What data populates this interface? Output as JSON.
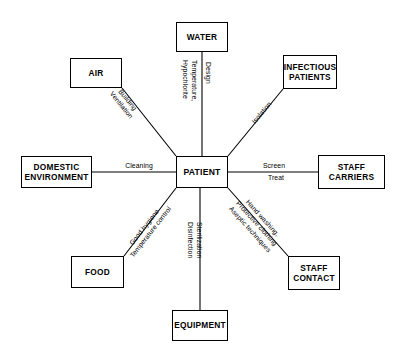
{
  "diagram": {
    "type": "radial-spoke-diagram",
    "center": {
      "id": "patient",
      "label": "PATIENT"
    },
    "nodes": [
      {
        "id": "water",
        "label": "WATER"
      },
      {
        "id": "air",
        "label": "AIR"
      },
      {
        "id": "infectious-patients",
        "label": "INFECTIOUS\nPATIENTS"
      },
      {
        "id": "domestic-environment",
        "label": "DOMESTIC\nENVIRONMENT"
      },
      {
        "id": "staff-carriers",
        "label": "STAFF\nCARRIERS"
      },
      {
        "id": "food",
        "label": "FOOD"
      },
      {
        "id": "staff-contact",
        "label": "STAFF\nCONTACT"
      },
      {
        "id": "equipment",
        "label": "EQUIPMENT"
      }
    ],
    "edges": [
      {
        "id": "water-patient",
        "from": "water",
        "to": "patient",
        "labels": [
          {
            "id": "water-left",
            "text": "Temperature,\nHypochlorite"
          },
          {
            "id": "water-right",
            "text": "Design"
          }
        ]
      },
      {
        "id": "air-patient",
        "from": "air",
        "to": "patient",
        "labels": [
          {
            "id": "air-measures",
            "text": "Building\nVentilation"
          }
        ]
      },
      {
        "id": "infectious-patients-patient",
        "from": "infectious-patients",
        "to": "patient",
        "labels": [
          {
            "id": "infectious-measure",
            "text": "Isolation"
          }
        ]
      },
      {
        "id": "domestic-environment-patient",
        "from": "domestic-environment",
        "to": "patient",
        "labels": [
          {
            "id": "domestic-measure",
            "text": "Cleaning"
          }
        ]
      },
      {
        "id": "staff-carriers-patient",
        "from": "staff-carriers",
        "to": "patient",
        "labels": [
          {
            "id": "carriers-above",
            "text": "Screen"
          },
          {
            "id": "carriers-below",
            "text": "Treat"
          }
        ]
      },
      {
        "id": "food-patient",
        "from": "food",
        "to": "patient",
        "labels": [
          {
            "id": "food-measures",
            "text": "Good hygiene\nTemperature control"
          }
        ]
      },
      {
        "id": "staff-contact-patient",
        "from": "staff-contact",
        "to": "patient",
        "labels": [
          {
            "id": "contact-measures",
            "text": "Hand washing,\nProtective clothing\nAseptic techniques"
          }
        ]
      },
      {
        "id": "equipment-patient",
        "from": "equipment",
        "to": "patient",
        "labels": [
          {
            "id": "equipment-measures",
            "text": "Sterilization\nDisinfection"
          }
        ]
      }
    ],
    "colors": {
      "background": "#ffffff",
      "stroke": "#000000",
      "text": "#000000"
    }
  }
}
